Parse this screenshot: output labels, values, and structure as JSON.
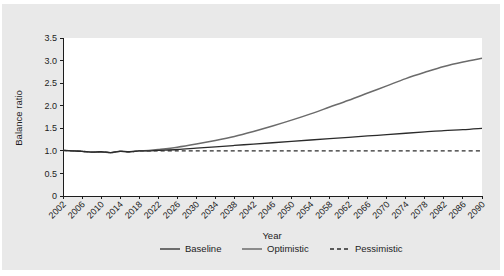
{
  "chart_data": {
    "type": "line",
    "title": "",
    "xlabel": "Year",
    "ylabel": "Balance ratio",
    "xlim": [
      2002,
      2090
    ],
    "ylim": [
      0,
      3.5
    ],
    "grid": false,
    "legend_position": "bottom",
    "ytick_labels": [
      "0",
      "0.5",
      "1.0",
      "1.5",
      "2.0",
      "2.5",
      "3.0",
      "3.5"
    ],
    "ytick_values": [
      0,
      0.5,
      1.0,
      1.5,
      2.0,
      2.5,
      3.0,
      3.5
    ],
    "xtick_labels": [
      "2002",
      "2006",
      "2010",
      "2014",
      "2018",
      "2022",
      "2026",
      "2030",
      "2034",
      "2038",
      "2042",
      "2046",
      "2050",
      "2054",
      "2058",
      "2062",
      "2066",
      "2070",
      "2074",
      "2078",
      "2082",
      "2086",
      "2090"
    ],
    "xtick_values": [
      2002,
      2006,
      2010,
      2014,
      2018,
      2022,
      2026,
      2030,
      2034,
      2038,
      2042,
      2046,
      2050,
      2054,
      2058,
      2062,
      2066,
      2070,
      2074,
      2078,
      2082,
      2086,
      2090
    ],
    "x": [
      2002,
      2004,
      2006,
      2008,
      2010,
      2012,
      2014,
      2016,
      2018,
      2020,
      2022,
      2026,
      2030,
      2034,
      2038,
      2042,
      2046,
      2050,
      2054,
      2058,
      2062,
      2066,
      2070,
      2074,
      2078,
      2082,
      2086,
      2090
    ],
    "series": [
      {
        "name": "Baseline",
        "style": "solid",
        "color": "#2b2b2b",
        "values": [
          1.01,
          1.0,
          0.99,
          0.97,
          0.98,
          0.96,
          0.99,
          0.98,
          1.0,
          1.0,
          1.01,
          1.03,
          1.06,
          1.09,
          1.12,
          1.15,
          1.18,
          1.21,
          1.24,
          1.27,
          1.3,
          1.33,
          1.36,
          1.39,
          1.42,
          1.45,
          1.47,
          1.5
        ]
      },
      {
        "name": "Optimistic",
        "style": "solid",
        "color": "#6b6b6b",
        "values": [
          1.01,
          1.0,
          0.99,
          0.97,
          0.98,
          0.96,
          0.99,
          0.98,
          1.0,
          1.01,
          1.03,
          1.08,
          1.15,
          1.23,
          1.32,
          1.43,
          1.55,
          1.68,
          1.82,
          1.97,
          2.12,
          2.28,
          2.44,
          2.6,
          2.74,
          2.87,
          2.97,
          3.05
        ]
      },
      {
        "name": "Pessimistic",
        "style": "dashed",
        "color": "#2b2b2b",
        "values": [
          1.01,
          1.0,
          0.99,
          0.97,
          0.98,
          0.96,
          0.99,
          0.98,
          1.0,
          1.0,
          1.0,
          1.0,
          1.0,
          1.0,
          1.0,
          1.0,
          1.0,
          1.0,
          1.0,
          1.0,
          1.0,
          1.0,
          1.0,
          1.0,
          1.0,
          1.0,
          1.0,
          1.0
        ]
      }
    ]
  },
  "legend": {
    "items": [
      {
        "label": "Baseline"
      },
      {
        "label": "Optimistic"
      },
      {
        "label": "Pessimistic"
      }
    ]
  }
}
